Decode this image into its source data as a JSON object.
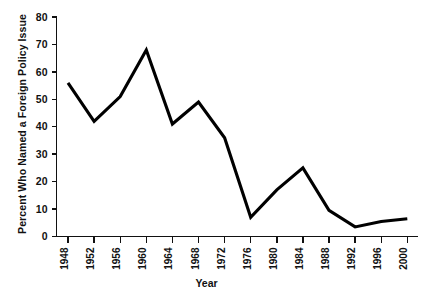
{
  "chart_data": {
    "type": "line",
    "title": "",
    "xlabel": "Year",
    "ylabel": "Percent Who Named a Foreign Policy Issue",
    "categories": [
      "1948",
      "1952",
      "1956",
      "1960",
      "1964",
      "1968",
      "1972",
      "1976",
      "1980",
      "1984",
      "1988",
      "1992",
      "1996",
      "2000"
    ],
    "x": [
      1948,
      1952,
      1956,
      1960,
      1964,
      1968,
      1972,
      1976,
      1980,
      1984,
      1988,
      1992,
      1996,
      2000
    ],
    "values": [
      56,
      42,
      51,
      68,
      41,
      49,
      36,
      7,
      17,
      25,
      9.5,
      3.5,
      5.5,
      6.5
    ],
    "series": [
      {
        "name": "Percent Who Named a Foreign Policy Issue",
        "values": [
          56,
          42,
          51,
          68,
          41,
          49,
          36,
          7,
          17,
          25,
          9.5,
          3.5,
          5.5,
          6.5
        ]
      }
    ],
    "ylim": [
      0,
      80
    ],
    "yticks": [
      0,
      10,
      20,
      30,
      40,
      50,
      60,
      70,
      80
    ],
    "ytick_labels": [
      "0",
      "10",
      "20",
      "30",
      "40",
      "50",
      "60",
      "70",
      "80"
    ],
    "xlim": [
      1946,
      2002
    ],
    "grid": false,
    "legend": false,
    "legend_position": "none",
    "line_color": "#000000",
    "background_color": "#ffffff"
  }
}
